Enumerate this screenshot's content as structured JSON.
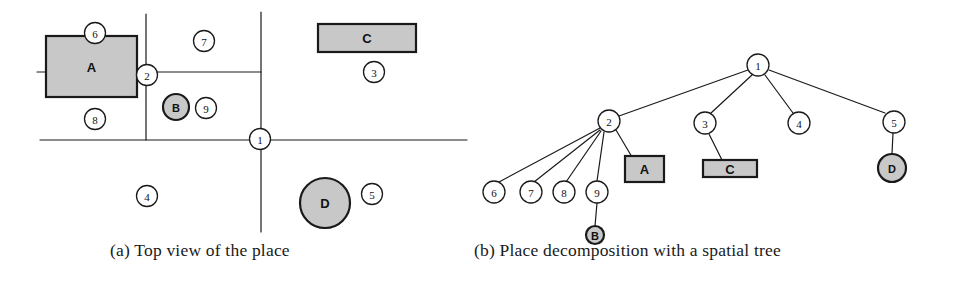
{
  "figure": {
    "colors": {
      "line": "#1a1a1a",
      "object_fill": "#c8c8c8",
      "node_fill": "#ffffff",
      "background": "#ffffff",
      "text": "#111111"
    }
  },
  "panel_a": {
    "caption": "(a) Top view of the place",
    "region_nodes": [
      {
        "id": "1",
        "label": "1",
        "cx": 260,
        "cy": 139,
        "r": 10.5
      },
      {
        "id": "2",
        "label": "2",
        "cx": 147,
        "cy": 75,
        "r": 10.5
      },
      {
        "id": "3",
        "label": "3",
        "cx": 374,
        "cy": 72,
        "r": 10.5
      },
      {
        "id": "4",
        "label": "4",
        "cx": 147,
        "cy": 196,
        "r": 10.5
      },
      {
        "id": "5",
        "label": "5",
        "cx": 372,
        "cy": 194,
        "r": 10.5
      },
      {
        "id": "6",
        "label": "6",
        "cx": 95,
        "cy": 33,
        "r": 10.5
      },
      {
        "id": "7",
        "label": "7",
        "cx": 204,
        "cy": 41,
        "r": 10.5
      },
      {
        "id": "8",
        "label": "8",
        "cx": 95,
        "cy": 119,
        "r": 10.5
      },
      {
        "id": "9",
        "label": "9",
        "cx": 206,
        "cy": 108,
        "r": 10.5
      }
    ],
    "walls": [
      {
        "name": "wall-vertical-left",
        "x1": 146,
        "y1": 14,
        "x2": 146,
        "y2": 140
      },
      {
        "name": "wall-vertical-center",
        "x1": 261,
        "y1": 12,
        "x2": 261,
        "y2": 232
      },
      {
        "name": "wall-horizontal-top",
        "x1": 37,
        "y1": 72,
        "x2": 261,
        "y2": 72
      },
      {
        "name": "wall-horizontal-main",
        "x1": 40,
        "y1": 140,
        "x2": 467,
        "y2": 140
      }
    ],
    "objects": [
      {
        "name": "object-a",
        "label": "A",
        "shape": "rect",
        "x": 46,
        "y": 36,
        "w": 91,
        "h": 61
      },
      {
        "name": "object-c",
        "label": "C",
        "shape": "rect",
        "x": 318,
        "y": 24,
        "w": 98,
        "h": 28
      },
      {
        "name": "object-b",
        "label": "B",
        "shape": "circle",
        "cx": 176,
        "cy": 107,
        "r": 13
      },
      {
        "name": "object-d",
        "label": "D",
        "shape": "circle",
        "cx": 325,
        "cy": 203,
        "r": 25
      }
    ]
  },
  "panel_b": {
    "caption": "(b) Place decomposition with a spatial tree",
    "tree_nodes": [
      {
        "id": "1",
        "label": "1",
        "cx": 758,
        "cy": 65,
        "r": 11
      },
      {
        "id": "2",
        "label": "2",
        "cx": 609,
        "cy": 121,
        "r": 11
      },
      {
        "id": "3",
        "label": "3",
        "cx": 705,
        "cy": 123,
        "r": 11
      },
      {
        "id": "4",
        "label": "4",
        "cx": 799,
        "cy": 123,
        "r": 11
      },
      {
        "id": "5",
        "label": "5",
        "cx": 894,
        "cy": 122,
        "r": 11
      },
      {
        "id": "6",
        "label": "6",
        "cx": 494,
        "cy": 192,
        "r": 11
      },
      {
        "id": "7",
        "label": "7",
        "cx": 531,
        "cy": 192,
        "r": 11
      },
      {
        "id": "8",
        "label": "8",
        "cx": 564,
        "cy": 192,
        "r": 11
      },
      {
        "id": "9",
        "label": "9",
        "cx": 597,
        "cy": 192,
        "r": 11
      }
    ],
    "tree_objects": [
      {
        "name": "tree-object-a",
        "label": "A",
        "shape": "rect",
        "x": 625,
        "y": 156,
        "w": 39,
        "h": 26
      },
      {
        "name": "tree-object-c",
        "label": "C",
        "shape": "rect",
        "x": 703,
        "y": 160,
        "w": 54,
        "h": 17
      },
      {
        "name": "tree-object-b",
        "label": "B",
        "shape": "circle",
        "cx": 595,
        "cy": 235,
        "r": 9
      },
      {
        "name": "tree-object-d",
        "label": "D",
        "shape": "circle",
        "cx": 892,
        "cy": 168,
        "r": 14
      }
    ],
    "edges": [
      {
        "from": "1",
        "to": "2"
      },
      {
        "from": "1",
        "to": "3"
      },
      {
        "from": "1",
        "to": "4"
      },
      {
        "from": "1",
        "to": "5"
      },
      {
        "from": "2",
        "to": "6"
      },
      {
        "from": "2",
        "to": "7"
      },
      {
        "from": "2",
        "to": "8"
      },
      {
        "from": "2",
        "to": "9"
      },
      {
        "from": "2",
        "to": "A"
      },
      {
        "from": "3",
        "to": "C"
      },
      {
        "from": "5",
        "to": "D"
      },
      {
        "from": "9",
        "to": "B"
      }
    ],
    "edge_paths": [
      {
        "name": "edge-1-2",
        "x1": 748,
        "y1": 70,
        "x2": 619,
        "y2": 116
      },
      {
        "name": "edge-1-3",
        "x1": 752,
        "y1": 75,
        "x2": 711,
        "y2": 113
      },
      {
        "name": "edge-1-4",
        "x1": 765,
        "y1": 75,
        "x2": 793,
        "y2": 113
      },
      {
        "name": "edge-1-5",
        "x1": 769,
        "y1": 70,
        "x2": 885,
        "y2": 113
      },
      {
        "name": "edge-2-6",
        "x1": 600,
        "y1": 128,
        "x2": 499,
        "y2": 182
      },
      {
        "name": "edge-2-7",
        "x1": 600,
        "y1": 130,
        "x2": 534,
        "y2": 182
      },
      {
        "name": "edge-2-8",
        "x1": 601,
        "y1": 131,
        "x2": 566,
        "y2": 182
      },
      {
        "name": "edge-2-9",
        "x1": 604,
        "y1": 132,
        "x2": 597,
        "y2": 181
      },
      {
        "name": "edge-2-a",
        "x1": 616,
        "y1": 130,
        "x2": 632,
        "y2": 157
      },
      {
        "name": "edge-3-c",
        "x1": 709,
        "y1": 134,
        "x2": 722,
        "y2": 160
      },
      {
        "name": "edge-5-d",
        "x1": 893,
        "y1": 133,
        "x2": 892,
        "y2": 154
      },
      {
        "name": "edge-9-b",
        "x1": 597,
        "y1": 203,
        "x2": 595,
        "y2": 226
      }
    ]
  }
}
